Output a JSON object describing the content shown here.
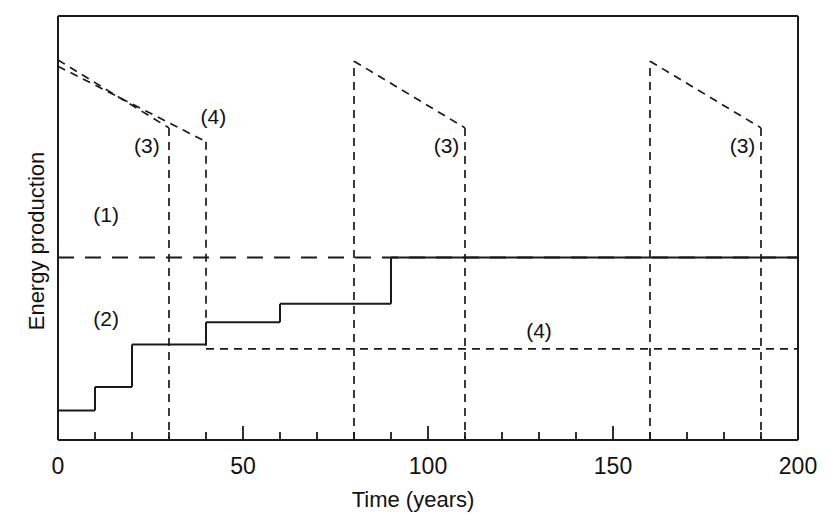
{
  "chart_data": {
    "type": "line",
    "title": "",
    "xlabel": "Time (years)",
    "ylabel": "Energy production",
    "xlim": [
      0,
      200
    ],
    "ylim": [
      0,
      1.08
    ],
    "grid": false,
    "legend": "inline-annotations",
    "xticks": [
      0,
      10,
      20,
      30,
      40,
      50,
      60,
      70,
      80,
      90,
      100,
      110,
      120,
      130,
      140,
      150,
      160,
      170,
      180,
      190,
      200
    ],
    "xtick_labels": [
      "0",
      "",
      "",
      "",
      "",
      "50",
      "",
      "",
      "",
      "",
      "100",
      "",
      "",
      "",
      "",
      "150",
      "",
      "",
      "",
      "",
      "200"
    ],
    "yticks": [],
    "ytick_labels": [],
    "annotations": [
      {
        "text": "(1)",
        "x": 13,
        "y": 0.565
      },
      {
        "text": "(2)",
        "x": 13,
        "y": 0.3
      },
      {
        "text": "(3)",
        "x": 24,
        "y": 0.74
      },
      {
        "text": "(4)",
        "x": 42,
        "y": 0.815
      },
      {
        "text": "(3)",
        "x": 105,
        "y": 0.74
      },
      {
        "text": "(4)",
        "x": 130,
        "y": 0.27
      },
      {
        "text": "(3)",
        "x": 185,
        "y": 0.74
      }
    ],
    "series": [
      {
        "name": "(1)",
        "style": "long-dashed",
        "description": "Constant energy production reference level",
        "x": [
          0,
          200
        ],
        "y": [
          0.465,
          0.465
        ]
      },
      {
        "name": "(2)",
        "style": "solid",
        "description": "Stepwise increasing energy production reaching plateau at year 90",
        "steps": [
          {
            "from": 0,
            "to": 10,
            "y": 0.075
          },
          {
            "from": 10,
            "to": 20,
            "y": 0.135
          },
          {
            "from": 20,
            "to": 30,
            "y": 0.243
          },
          {
            "from": 30,
            "to": 40,
            "y": 0.243
          },
          {
            "from": 40,
            "to": 60,
            "y": 0.3
          },
          {
            "from": 60,
            "to": 90,
            "y": 0.347
          },
          {
            "from": 90,
            "to": 200,
            "y": 0.465
          }
        ]
      },
      {
        "name": "(3)",
        "style": "dashed",
        "description": "Declining-sawtooth cycles with abrupt drops at years 30, 110 and 190",
        "segments": [
          {
            "x": [
              0,
              30
            ],
            "y": [
              0.968,
              0.795
            ],
            "kind": "decay"
          },
          {
            "x": [
              30,
              30
            ],
            "y": [
              0.795,
              0.0
            ],
            "kind": "drop"
          },
          {
            "x": [
              80,
              80
            ],
            "y": [
              0.0,
              0.965
            ],
            "kind": "rise"
          },
          {
            "x": [
              80,
              110
            ],
            "y": [
              0.965,
              0.795
            ],
            "kind": "decay"
          },
          {
            "x": [
              110,
              110
            ],
            "y": [
              0.795,
              0.0
            ],
            "kind": "drop"
          },
          {
            "x": [
              160,
              160
            ],
            "y": [
              0.0,
              0.965
            ],
            "kind": "rise"
          },
          {
            "x": [
              160,
              190
            ],
            "y": [
              0.965,
              0.795
            ],
            "kind": "decay"
          },
          {
            "x": [
              190,
              190
            ],
            "y": [
              0.795,
              0.0
            ],
            "kind": "drop"
          }
        ]
      },
      {
        "name": "(4)",
        "style": "short-dashed",
        "description": "Declining line dropping at year 40 to a sustained lower level",
        "segments": [
          {
            "x": [
              0,
              40
            ],
            "y": [
              0.952,
              0.76
            ],
            "kind": "decay"
          },
          {
            "x": [
              40,
              40
            ],
            "y": [
              0.76,
              0.232
            ],
            "kind": "drop"
          },
          {
            "x": [
              40,
              200
            ],
            "y": [
              0.232,
              0.232
            ],
            "kind": "plateau"
          }
        ]
      }
    ]
  },
  "axis": {
    "x_title": "Time (years)",
    "y_title": "Energy production",
    "x_labels": [
      "0",
      "50",
      "100",
      "150",
      "200"
    ]
  },
  "colors": {
    "ink": "#1a1a1a",
    "background": "#ffffff"
  }
}
